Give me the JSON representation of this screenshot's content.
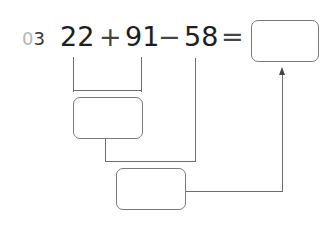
{
  "problem": {
    "number_prefix": "0",
    "number_suffix": "3",
    "operand1": "22",
    "op1": "+",
    "operand2": "91",
    "op2": "−",
    "operand3": "58",
    "equals": "="
  },
  "boxes": {
    "result": "",
    "step1": "",
    "step2": ""
  },
  "colors": {
    "text": "#1e1e1e",
    "number_gray": "#b5b5b5",
    "line": "#6e6e6e"
  }
}
